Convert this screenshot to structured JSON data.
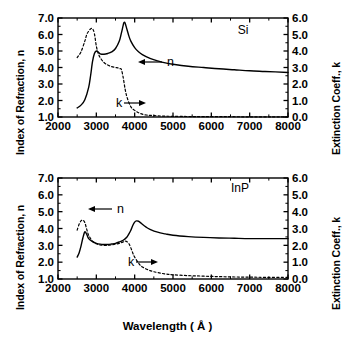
{
  "figure": {
    "xlabel": "Wavelength ( Å )",
    "ylabel_left": "Index of Refraction, n",
    "ylabel_right": "Extinction Coeff., k"
  },
  "panels": [
    {
      "id": "si",
      "material_label": "Si",
      "annotation_n": "n",
      "annotation_k": "k",
      "arrow_n": "←",
      "arrow_k": "→",
      "xticklabels": [
        "2000",
        "3000",
        "4000",
        "5000",
        "6000",
        "7000",
        "8000"
      ],
      "yticklabels_left": [
        "1.0",
        "2.0",
        "3.0",
        "4.0",
        "5.0",
        "6.0",
        "7.0"
      ],
      "yticklabels_right": [
        "0.0",
        "1.0",
        "2.0",
        "3.0",
        "4.0",
        "5.0",
        "6.0"
      ]
    },
    {
      "id": "inp",
      "material_label": "InP",
      "annotation_n": "n",
      "annotation_k": "k",
      "arrow_n": "←",
      "arrow_k": "→",
      "xticklabels": [
        "2000",
        "3000",
        "4000",
        "5000",
        "6000",
        "7000",
        "8000"
      ],
      "yticklabels_left": [
        "1.0",
        "2.0",
        "3.0",
        "4.0",
        "5.0",
        "6.0",
        "7.0"
      ],
      "yticklabels_right": [
        "0.0",
        "1.0",
        "2.0",
        "3.0",
        "4.0",
        "5.0",
        "6.0"
      ]
    }
  ],
  "chart_data": [
    {
      "type": "line",
      "title": "Si",
      "xlabel": "Wavelength ( Å )",
      "ylabel": "Index of Refraction, n",
      "ylabel_secondary": "Extinction Coeff., k",
      "xlim": [
        2000,
        8000
      ],
      "ylim": [
        1.0,
        7.0
      ],
      "ylim_secondary": [
        0.0,
        6.0
      ],
      "grid": false,
      "legend": "inline-annotations",
      "xticks": [
        2000,
        3000,
        4000,
        5000,
        6000,
        7000,
        8000
      ],
      "yticks": [
        1.0,
        2.0,
        3.0,
        4.0,
        5.0,
        6.0,
        7.0
      ],
      "yticks_secondary": [
        0.0,
        1.0,
        2.0,
        3.0,
        4.0,
        5.0,
        6.0
      ],
      "series": [
        {
          "name": "n",
          "axis": "left",
          "style": "solid",
          "color": "#000000",
          "x": [
            2500,
            2600,
            2700,
            2800,
            2850,
            2900,
            2950,
            3000,
            3050,
            3100,
            3200,
            3300,
            3400,
            3500,
            3600,
            3650,
            3700,
            3720,
            3750,
            3800,
            3850,
            3900,
            4000,
            4100,
            4200,
            4400,
            4600,
            4800,
            5000,
            5400,
            5800,
            6200,
            6600,
            7000,
            7400,
            8000
          ],
          "y": [
            1.55,
            1.72,
            2.05,
            2.8,
            3.5,
            4.35,
            4.85,
            5.0,
            4.93,
            4.83,
            4.8,
            4.85,
            4.95,
            5.15,
            5.6,
            6.05,
            6.55,
            6.72,
            6.7,
            6.3,
            5.9,
            5.6,
            5.2,
            4.95,
            4.78,
            4.55,
            4.4,
            4.28,
            4.2,
            4.08,
            4.0,
            3.92,
            3.86,
            3.8,
            3.76,
            3.7
          ]
        },
        {
          "name": "k",
          "axis": "right",
          "style": "dashed",
          "color": "#000000",
          "x": [
            2500,
            2600,
            2700,
            2750,
            2800,
            2850,
            2900,
            2950,
            3000,
            3050,
            3100,
            3200,
            3300,
            3400,
            3500,
            3560,
            3600,
            3650,
            3700,
            3750,
            3800,
            3900,
            4000,
            4100,
            4200,
            4300,
            4400,
            4600,
            4800,
            5000,
            5400,
            5800,
            6400,
            7000,
            7600,
            8000
          ],
          "y": [
            3.6,
            3.95,
            4.6,
            5.0,
            5.2,
            5.34,
            5.35,
            5.05,
            4.3,
            3.85,
            3.6,
            3.3,
            3.15,
            3.05,
            3.0,
            2.98,
            2.92,
            2.9,
            2.4,
            1.7,
            1.2,
            0.62,
            0.4,
            0.26,
            0.17,
            0.12,
            0.1,
            0.07,
            0.05,
            0.04,
            0.03,
            0.02,
            0.02,
            0.01,
            0.01,
            0.01
          ]
        }
      ]
    },
    {
      "type": "line",
      "title": "InP",
      "xlabel": "Wavelength ( Å )",
      "ylabel": "Index of Refraction, n",
      "ylabel_secondary": "Extinction Coeff., k",
      "xlim": [
        2000,
        8000
      ],
      "ylim": [
        1.0,
        7.0
      ],
      "ylim_secondary": [
        0.0,
        6.0
      ],
      "grid": false,
      "legend": "inline-annotations",
      "xticks": [
        2000,
        3000,
        4000,
        5000,
        6000,
        7000,
        8000
      ],
      "yticks": [
        1.0,
        2.0,
        3.0,
        4.0,
        5.0,
        6.0,
        7.0
      ],
      "yticks_secondary": [
        0.0,
        1.0,
        2.0,
        3.0,
        4.0,
        5.0,
        6.0
      ],
      "series": [
        {
          "name": "n",
          "axis": "left",
          "style": "solid",
          "color": "#000000",
          "x": [
            2500,
            2550,
            2600,
            2650,
            2700,
            2750,
            2800,
            2900,
            3000,
            3100,
            3200,
            3300,
            3400,
            3500,
            3600,
            3700,
            3800,
            3850,
            3900,
            3950,
            4000,
            4050,
            4100,
            4150,
            4200,
            4300,
            4400,
            4600,
            4800,
            5000,
            5400,
            5800,
            6200,
            6600,
            7000,
            7400,
            8000
          ],
          "y": [
            2.3,
            2.55,
            2.95,
            3.45,
            3.8,
            3.65,
            3.4,
            3.22,
            3.12,
            3.07,
            3.05,
            3.05,
            3.08,
            3.12,
            3.2,
            3.3,
            3.5,
            3.68,
            3.9,
            4.18,
            4.38,
            4.45,
            4.43,
            4.35,
            4.25,
            4.08,
            3.95,
            3.78,
            3.68,
            3.6,
            3.52,
            3.47,
            3.44,
            3.42,
            3.4,
            3.4,
            3.4
          ]
        },
        {
          "name": "k",
          "axis": "right",
          "style": "dashed",
          "color": "#000000",
          "x": [
            2500,
            2550,
            2600,
            2650,
            2700,
            2750,
            2800,
            2900,
            3000,
            3100,
            3200,
            3300,
            3400,
            3500,
            3600,
            3700,
            3750,
            3800,
            3850,
            3900,
            3950,
            4000,
            4100,
            4200,
            4400,
            4600,
            4800,
            5000,
            5400,
            5800,
            6200,
            6600,
            7000,
            7400,
            8000
          ],
          "y": [
            2.9,
            3.25,
            3.45,
            3.5,
            3.35,
            2.95,
            2.6,
            2.25,
            2.1,
            2.02,
            2.0,
            2.0,
            2.03,
            2.07,
            2.12,
            2.2,
            2.25,
            2.22,
            2.1,
            1.85,
            1.55,
            1.3,
            0.95,
            0.72,
            0.5,
            0.38,
            0.3,
            0.25,
            0.2,
            0.17,
            0.14,
            0.12,
            0.11,
            0.1,
            0.1
          ]
        }
      ]
    }
  ]
}
